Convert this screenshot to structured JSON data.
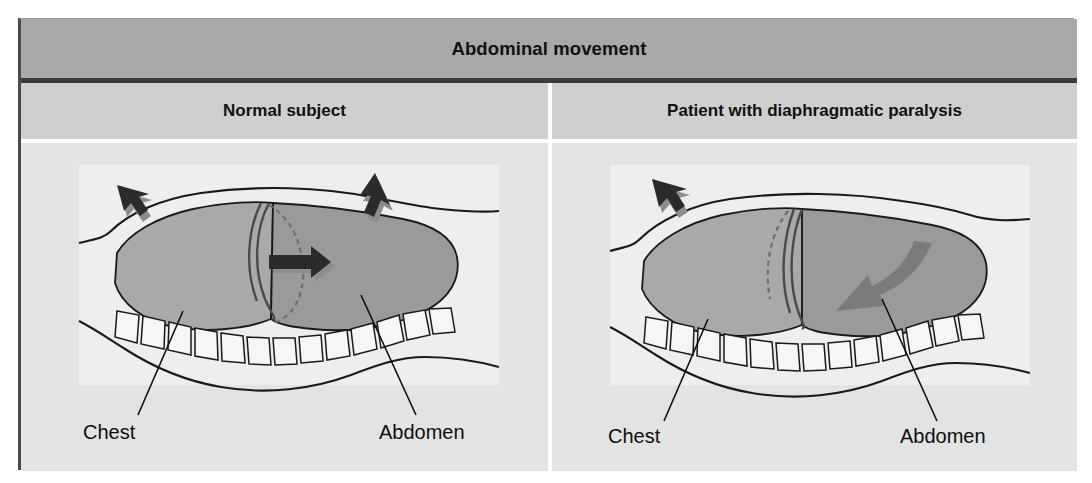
{
  "figure": {
    "title": "Abdominal movement",
    "columns": [
      {
        "id": "normal",
        "label": "Normal subject"
      },
      {
        "id": "paralysis",
        "label": "Patient with diaphragmatic paralysis"
      }
    ]
  },
  "panels": {
    "left": {
      "column_label": "Normal subject",
      "labels": {
        "chest": "Chest",
        "abdomen": "Abdomen"
      },
      "arrows": [
        {
          "name": "chest-outward-arrow",
          "direction": "up-left",
          "style": "solid-black"
        },
        {
          "name": "abdomen-outward-arrow",
          "direction": "up-right",
          "style": "solid-black"
        },
        {
          "name": "diaphragm-descent-arrow",
          "direction": "right",
          "style": "solid-black"
        }
      ],
      "diaphragm": {
        "resting": "solid",
        "displaced": "dashed"
      }
    },
    "right": {
      "column_label": "Patient with diaphragmatic paralysis",
      "labels": {
        "chest": "Chest",
        "abdomen": "Abdomen"
      },
      "arrows": [
        {
          "name": "chest-outward-arrow",
          "direction": "up-left",
          "style": "solid-black"
        },
        {
          "name": "abdomen-inward-arrow",
          "direction": "curved-down-left",
          "style": "grey-curved"
        }
      ],
      "diaphragm": {
        "resting": "solid",
        "displaced": "dashed"
      }
    }
  },
  "colors": {
    "title_band": "#a8a8a8",
    "subheader_band": "#cfcfcf",
    "panel_background": "#e3e3e3",
    "chest_fill": "#a9a9a9",
    "abdomen_fill": "#9a9a9a",
    "outline": "#1a1a1a",
    "divider": "#3a3a3a",
    "arrow_solid": "#2b2b2b",
    "arrow_grey": "#7b7b7b"
  }
}
